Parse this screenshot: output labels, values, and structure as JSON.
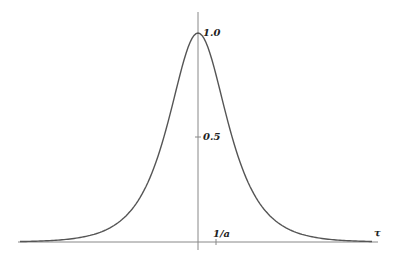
{
  "chart_data": {
    "type": "line",
    "title": "",
    "xlabel": "τ",
    "ylabel": "",
    "function": "sech-shaped pulse centered at τ = 0, peak 1.0",
    "y_ticks": [
      {
        "value": 0.5,
        "label": "0.5"
      },
      {
        "value": 1.0,
        "label": "1.0"
      }
    ],
    "x_ticks": [
      {
        "value": 1,
        "label": "1/a"
      }
    ],
    "ylim": [
      0,
      1.0
    ],
    "xlim_in_units_of_1_over_a": [
      -10,
      10.5
    ],
    "grid": false,
    "legend": null,
    "series": [
      {
        "name": "pulse",
        "x": [
          -10,
          -8,
          -6,
          -5,
          -4,
          -3,
          -2.5,
          -2,
          -1.5,
          -1,
          -0.5,
          0,
          0.5,
          1,
          1.5,
          2,
          2.5,
          3,
          4,
          5,
          6,
          8,
          10
        ],
        "values": [
          0.01,
          0.02,
          0.05,
          0.08,
          0.13,
          0.22,
          0.29,
          0.38,
          0.52,
          0.68,
          0.88,
          1.0,
          0.88,
          0.68,
          0.52,
          0.38,
          0.29,
          0.22,
          0.13,
          0.08,
          0.05,
          0.02,
          0.01
        ]
      }
    ],
    "colors": {
      "curve": "#555555",
      "axes": "#888888"
    }
  },
  "labels": {
    "peak": "1.0",
    "half": "0.5",
    "tick_x": "1/a",
    "x_axis": "τ"
  }
}
